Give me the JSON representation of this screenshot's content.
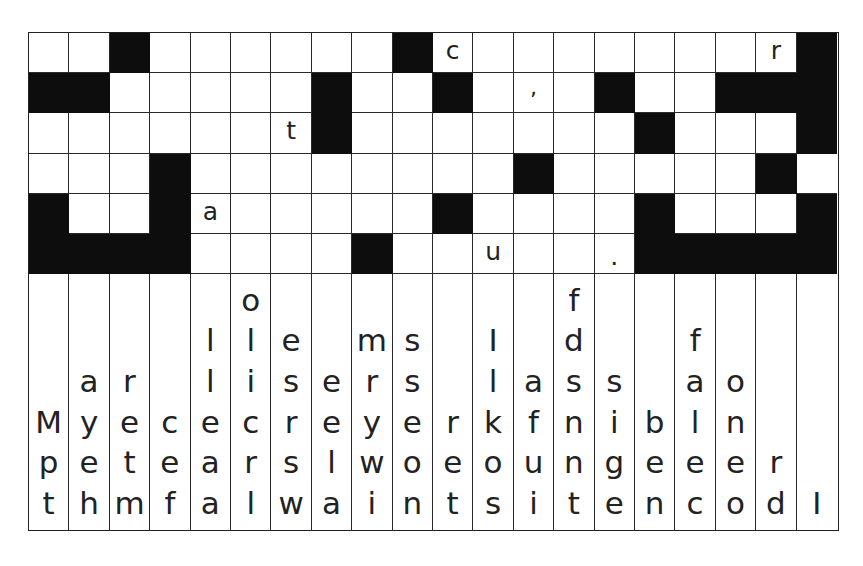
{
  "puzzle": {
    "type": "quote-falls",
    "columns": 20,
    "rows": 6,
    "grid": [
      [
        "",
        "",
        "#",
        "",
        "",
        "",
        "",
        "",
        "",
        "#",
        "c",
        "",
        "",
        "",
        "",
        "",
        "",
        "",
        "r",
        "#"
      ],
      [
        "#",
        "#",
        "",
        "",
        "",
        "",
        "",
        "#",
        "",
        "",
        "#",
        "",
        ",",
        "",
        "#",
        "",
        "",
        "#",
        "#",
        "#"
      ],
      [
        "",
        "",
        "",
        "",
        "",
        "",
        "t",
        "#",
        "",
        "",
        "",
        "",
        "",
        "",
        "",
        "#",
        "",
        "",
        "",
        "#"
      ],
      [
        "",
        "",
        "",
        "#",
        "",
        "",
        "",
        "",
        "",
        "",
        "",
        "",
        "#",
        "",
        "",
        "",
        "",
        "",
        "#",
        ""
      ],
      [
        "#",
        "",
        "",
        "#",
        "a",
        "",
        "",
        "",
        "",
        "",
        "#",
        "",
        "",
        "",
        "",
        "#",
        "",
        "",
        "",
        "#"
      ],
      [
        "#",
        "#",
        "#",
        "#",
        "",
        "",
        "",
        "",
        "#",
        "",
        "",
        "u",
        "",
        "",
        ".",
        "#",
        "#",
        "#",
        "#",
        "#"
      ]
    ],
    "letter_columns": [
      [
        "",
        "",
        "",
        "M",
        "p",
        "t"
      ],
      [
        "",
        "",
        "a",
        "y",
        "e",
        "h"
      ],
      [
        "",
        "",
        "r",
        "e",
        "t",
        "m"
      ],
      [
        "",
        "",
        "",
        "c",
        "e",
        "f"
      ],
      [
        "",
        "l",
        "l",
        "e",
        "a",
        "a"
      ],
      [
        "o",
        "l",
        "i",
        "c",
        "r",
        "l"
      ],
      [
        "",
        "e",
        "s",
        "r",
        "s",
        "w"
      ],
      [
        "",
        "",
        "e",
        "e",
        "l",
        "a"
      ],
      [
        "",
        "m",
        "r",
        "y",
        "w",
        "i"
      ],
      [
        "",
        "s",
        "s",
        "e",
        "o",
        "n"
      ],
      [
        "",
        "",
        "",
        "r",
        "e",
        "t"
      ],
      [
        "",
        "I",
        "l",
        "k",
        "o",
        "s"
      ],
      [
        "",
        "",
        "a",
        "f",
        "u",
        "i"
      ],
      [
        "f",
        "d",
        "s",
        "n",
        "n",
        "t"
      ],
      [
        "",
        "",
        "s",
        "i",
        "g",
        "e"
      ],
      [
        "",
        "",
        "",
        "b",
        "e",
        "n"
      ],
      [
        "",
        "f",
        "a",
        "l",
        "e",
        "c"
      ],
      [
        "",
        "",
        "o",
        "n",
        "e",
        "o"
      ],
      [
        "",
        "",
        "",
        "",
        "r",
        "d"
      ],
      [
        "",
        "",
        "",
        "",
        "",
        "I"
      ]
    ]
  },
  "colors": {
    "black_cell": "#0d0d0d",
    "grid_line": "#2a2a2a",
    "background": "#ffffff",
    "text": "#222222"
  }
}
